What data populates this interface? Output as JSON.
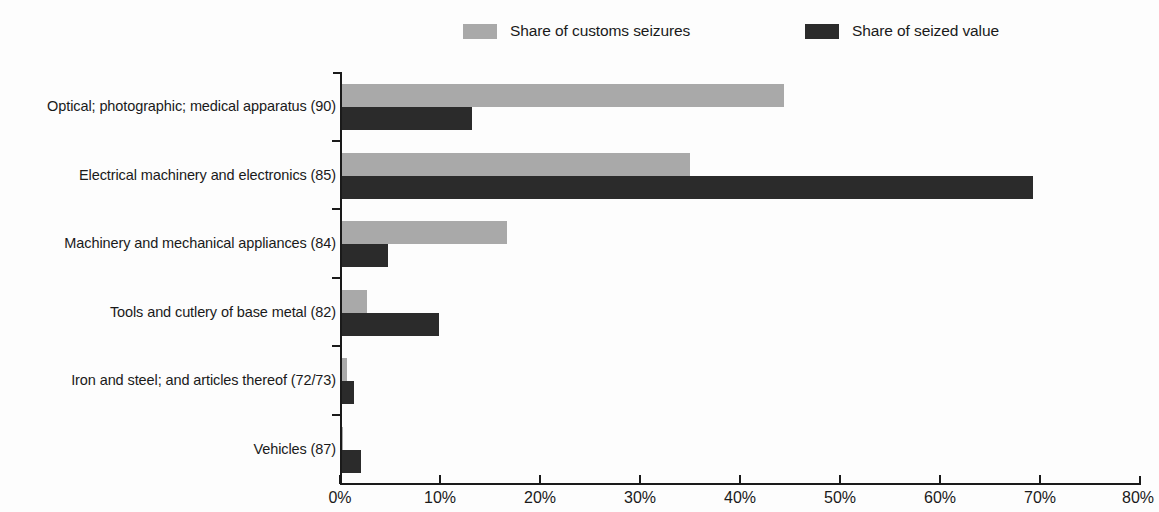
{
  "legend": {
    "items": [
      {
        "label": "Share of customs seizures",
        "color": "#a9a9a9",
        "key": "seizures"
      },
      {
        "label": "Share of seized value",
        "color": "#2b2b2b",
        "key": "value"
      }
    ]
  },
  "axis": {
    "x_ticks": [
      "0%",
      "10%",
      "20%",
      "30%",
      "40%",
      "50%",
      "60%",
      "70%",
      "80%"
    ]
  },
  "chart_data": {
    "type": "bar",
    "orientation": "horizontal",
    "title": "",
    "subtitle": "",
    "xlabel": "",
    "ylabel": "",
    "xlim": [
      0,
      80
    ],
    "xtick_values": [
      0,
      10,
      20,
      30,
      40,
      50,
      60,
      70,
      80
    ],
    "xtick_labels": [
      "0%",
      "10%",
      "20%",
      "30%",
      "40%",
      "50%",
      "60%",
      "70%",
      "80%"
    ],
    "grid": false,
    "legend_position": "top-center",
    "units": "percent",
    "categories": [
      "Optical; photographic; medical apparatus (90)",
      "Electrical machinery and electronics (85)",
      "Machinery and mechanical appliances (84)",
      "Tools and cutlery of base metal (82)",
      "Iron and steel; and articles thereof (72/73)",
      "Vehicles (87)"
    ],
    "series": [
      {
        "name": "Share of customs seizures",
        "color": "#a9a9a9",
        "values": [
          44.3,
          34.8,
          16.5,
          2.5,
          0.5,
          0.1
        ]
      },
      {
        "name": "Share of seized value",
        "color": "#2b2b2b",
        "values": [
          13.0,
          69.2,
          4.6,
          9.7,
          1.2,
          1.9
        ]
      }
    ]
  }
}
